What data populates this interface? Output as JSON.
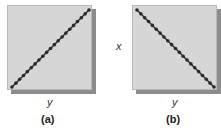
{
  "chart_data": [
    {
      "type": "scatter",
      "panel": "(a)",
      "title": "",
      "xlabel": "y",
      "ylabel": "",
      "grid": false,
      "description": "Perfect positive linear relationship",
      "x": [
        0,
        1,
        2,
        3,
        4,
        5,
        6,
        7,
        8,
        9,
        10,
        11,
        12,
        13,
        14,
        15,
        16,
        17,
        18,
        19,
        20
      ],
      "values": [
        0,
        1,
        2,
        3,
        4,
        5,
        6,
        7,
        8,
        9,
        10,
        11,
        12,
        13,
        14,
        15,
        16,
        17,
        18,
        19,
        20
      ],
      "color": "#2a2a2a"
    },
    {
      "type": "scatter",
      "panel": "(b)",
      "title": "",
      "xlabel": "y",
      "ylabel": "x",
      "grid": false,
      "description": "Perfect negative linear relationship",
      "x": [
        0,
        1,
        2,
        3,
        4,
        5,
        6,
        7,
        8,
        9,
        10,
        11,
        12,
        13,
        14,
        15,
        16,
        17,
        18,
        19,
        20
      ],
      "values": [
        20,
        19,
        18,
        17,
        16,
        15,
        14,
        13,
        12,
        11,
        10,
        9,
        8,
        7,
        6,
        5,
        4,
        3,
        2,
        1,
        0
      ],
      "color": "#2a2a2a"
    }
  ],
  "panels": {
    "a": {
      "caption": "(a)",
      "xlabel": "y",
      "ylabel": ""
    },
    "b": {
      "caption": "(b)",
      "xlabel": "y",
      "ylabel": "x"
    }
  },
  "colors": {
    "plot_bg": "#d6d6d6",
    "shadow": "#8c8c8c",
    "line": "#2a2a2a"
  }
}
